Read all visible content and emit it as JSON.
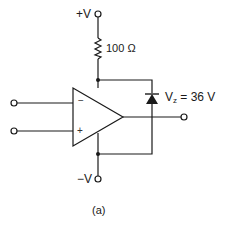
{
  "diagram": {
    "type": "op-amp circuit with zener diode clamp",
    "caption": "(a)",
    "supply_positive": {
      "label": "+V"
    },
    "supply_negative": {
      "label": "−V"
    },
    "resistor": {
      "label": "100 Ω"
    },
    "zener": {
      "prefix": "V",
      "subscript": "z",
      "suffix": " = 36 V"
    },
    "opamp": {
      "inverting_sign": "−",
      "noninverting_sign": "+"
    },
    "terminals": [
      "inverting-input",
      "noninverting-input",
      "output",
      "positive-supply",
      "negative-supply"
    ],
    "colors": {
      "stroke": "#1a1a1a",
      "background": "#ffffff"
    }
  }
}
